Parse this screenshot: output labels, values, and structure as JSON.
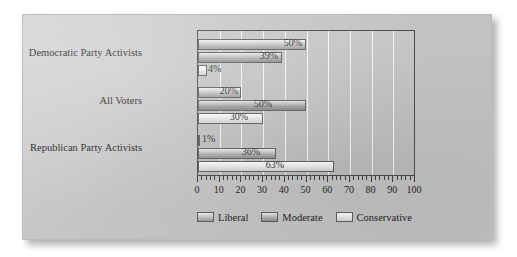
{
  "chart_data": {
    "type": "bar",
    "orientation": "horizontal",
    "title": "",
    "xlabel": "",
    "ylabel": "",
    "xlim": [
      0,
      100
    ],
    "xticks": [
      0,
      10,
      20,
      30,
      40,
      50,
      60,
      70,
      80,
      90,
      100
    ],
    "xtick_labels": [
      "0",
      "10",
      "20",
      "30",
      "40",
      "50",
      "60",
      "70",
      "80",
      "90",
      "100"
    ],
    "minor_tick_step": 2,
    "grid": "vertical-major-white",
    "legend_position": "bottom",
    "categories": [
      "Democratic Party Activists",
      "All Voters",
      "Republican Party Activists"
    ],
    "series": [
      {
        "name": "Liberal",
        "color": "#bdbdbd",
        "values": [
          50,
          20,
          1
        ],
        "labels": [
          "50%",
          "20%",
          "1%"
        ]
      },
      {
        "name": "Moderate",
        "color": "#a8a8a8",
        "values": [
          39,
          50,
          36
        ],
        "labels": [
          "39%",
          "50%",
          "36%"
        ]
      },
      {
        "name": "Conservative",
        "color": "#e4e4e4",
        "values": [
          4,
          30,
          63
        ],
        "labels": [
          "4%",
          "30%",
          "63%"
        ]
      }
    ]
  },
  "legend": {
    "items": [
      {
        "label": "Liberal",
        "swatch": "liberal-swatch"
      },
      {
        "label": "Moderate",
        "swatch": "moderate-swatch"
      },
      {
        "label": "Conservative",
        "swatch": "conservative-swatch"
      }
    ]
  },
  "axis": {
    "ticks": [
      "0",
      "10",
      "20",
      "30",
      "40",
      "50",
      "60",
      "70",
      "80",
      "90",
      "100"
    ]
  },
  "categories": {
    "democratic": "Democratic Party Activists",
    "all_voters": "All Voters",
    "republican": "Republican Party Activists"
  },
  "bars": {
    "dem_liberal": "50%",
    "dem_moderate": "39%",
    "dem_conservative": "4%",
    "all_liberal": "20%",
    "all_moderate": "50%",
    "all_conservative": "30%",
    "rep_liberal": "1%",
    "rep_moderate": "36%",
    "rep_conservative": "63%"
  },
  "colors": {
    "card_background": "#c3c3c3",
    "plot_background": "#c0c0c0",
    "frame": "#4a4a4a",
    "gridline": "#ffffff",
    "text": "#232323"
  }
}
